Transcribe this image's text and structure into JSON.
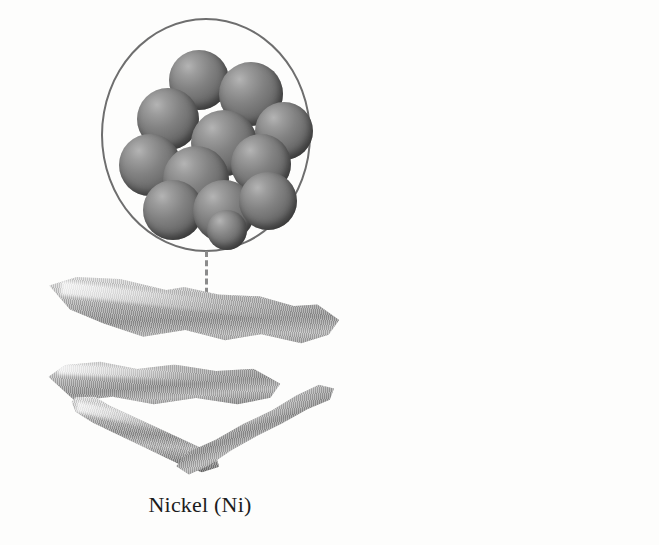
{
  "figure": {
    "background_color": "#fdfdfc",
    "width": 659,
    "height": 545
  },
  "panels": [
    {
      "id": "nickel",
      "caption": "Nickel (Ni)",
      "element_name": "Nickel",
      "element_symbol": "Ni",
      "magnifier": {
        "name": "atomic-structure-circle",
        "shape": "circle",
        "stroke_color": "#6e6e6e",
        "fill_color": "#fdfdfc",
        "atom_count": 12,
        "atom_color": "#7a7a7a",
        "atom_highlight_color": "#b4b4b4",
        "atom_shadow_color": "#4a4a4a",
        "description": "close-packed cluster of metal atoms"
      },
      "leader_line": {
        "name": "dashed-leader-line",
        "style": "dashed",
        "color": "#8b8b8b"
      },
      "marker": {
        "name": "callout-marker",
        "style": "single-ring",
        "color": "#3b3b3b"
      },
      "specimen": {
        "name": "nickel-metal-fragments",
        "description": "four elongated shiny silver-grey metal slivers",
        "piece_count": 4,
        "surface": "lustrous striated",
        "base_color": "#a9a9a9"
      }
    },
    {
      "id": "zinc",
      "caption": "Zinc (Zn)",
      "element_name": "Zinc",
      "element_symbol": "Zn",
      "magnifier": {
        "name": "atomic-structure-circle",
        "shape": "circle",
        "stroke_color": "#6e6e6e",
        "fill_color": "#fdfdfc",
        "atom_count": 12,
        "atom_color": "#5e5e5e",
        "atom_highlight_color": "#a8a8a8",
        "atom_shadow_color": "#3e3e3e",
        "description": "close-packed cluster of metal atoms"
      },
      "leader_line": {
        "name": "dashed-leader-line",
        "style": "dashed",
        "color": "#8b8b8b"
      },
      "marker": {
        "name": "callout-marker",
        "style": "double-ring",
        "color": "#dcdcdc"
      },
      "specimen": {
        "name": "zinc-metal-block",
        "description": "single chunky crystalline zinc block, dark top facet with striated lower face",
        "piece_count": 1,
        "surface": "crystalline striated",
        "base_color": "#4c4c4c"
      }
    }
  ],
  "atoms": {
    "nickel_cluster": [
      {
        "x": 62,
        "y": 20,
        "d": 60
      },
      {
        "x": 112,
        "y": 32,
        "d": 64
      },
      {
        "x": 30,
        "y": 58,
        "d": 62
      },
      {
        "x": 148,
        "y": 72,
        "d": 58
      },
      {
        "x": 84,
        "y": 80,
        "d": 66
      },
      {
        "x": 12,
        "y": 104,
        "d": 62
      },
      {
        "x": 56,
        "y": 116,
        "d": 66
      },
      {
        "x": 124,
        "y": 104,
        "d": 60
      },
      {
        "x": 36,
        "y": 150,
        "d": 60
      },
      {
        "x": 86,
        "y": 150,
        "d": 62
      },
      {
        "x": 132,
        "y": 142,
        "d": 58
      },
      {
        "x": 100,
        "y": 180,
        "d": 40
      }
    ],
    "zinc_cluster": [
      {
        "x": 68,
        "y": 14,
        "d": 58
      },
      {
        "x": 120,
        "y": 28,
        "d": 58
      },
      {
        "x": 28,
        "y": 52,
        "d": 58
      },
      {
        "x": 88,
        "y": 48,
        "d": 60
      },
      {
        "x": 142,
        "y": 64,
        "d": 56
      },
      {
        "x": 16,
        "y": 96,
        "d": 58
      },
      {
        "x": 62,
        "y": 88,
        "d": 60
      },
      {
        "x": 116,
        "y": 92,
        "d": 58
      },
      {
        "x": 40,
        "y": 126,
        "d": 58
      },
      {
        "x": 92,
        "y": 128,
        "d": 58
      },
      {
        "x": 136,
        "y": 118,
        "d": 56
      },
      {
        "x": 66,
        "y": 156,
        "d": 54
      }
    ]
  }
}
